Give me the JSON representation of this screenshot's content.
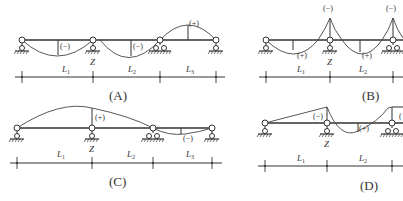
{
  "panels": [
    {
      "id": "A",
      "label": "(A)",
      "signs": [
        "(−)",
        "(−)",
        "(+)"
      ],
      "support_label": "Z",
      "spans": [
        "L",
        "L",
        "L"
      ],
      "span_subs": [
        "1",
        "2",
        "3"
      ]
    },
    {
      "id": "B",
      "label": "(B)",
      "signs": [
        "(+)",
        "(+)",
        "(−)",
        "(−)"
      ],
      "support_label": "Z",
      "spans": [
        "L",
        "L"
      ],
      "span_subs": [
        "1",
        "2"
      ]
    },
    {
      "id": "C",
      "label": "(C)",
      "signs": [
        "(+)",
        "(−)"
      ],
      "support_label": "Z",
      "spans": [
        "L",
        "L",
        "L"
      ],
      "span_subs": [
        "1",
        "2",
        "3"
      ]
    },
    {
      "id": "D",
      "label": "(D)",
      "signs": [
        "(−)",
        "(+)",
        "("
      ],
      "support_label": "Z",
      "spans": [
        "L",
        "L"
      ],
      "span_subs": [
        "1",
        "2"
      ]
    }
  ],
  "colors": {
    "line": "#333333",
    "background": "#ffffff"
  }
}
